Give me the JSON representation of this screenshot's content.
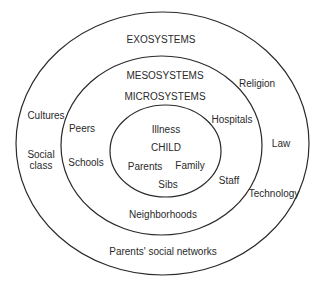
{
  "diagram": {
    "type": "nested-systems",
    "rings": [
      {
        "name": "exosystems",
        "label": "EXOSYSTEMS"
      },
      {
        "name": "mesosystems",
        "label": "MESOSYSTEMS"
      },
      {
        "name": "microsystems",
        "label": "MICROSYSTEMS"
      }
    ],
    "center": {
      "label": "CHILD"
    },
    "inner_items": [
      "Illness",
      "Parents",
      "Family",
      "Sibs"
    ],
    "middle_items": [
      "Peers",
      "Schools",
      "Hospitals",
      "Staff",
      "Neighborhoods"
    ],
    "outer_items": [
      "Cultures",
      "Social class",
      "Religion",
      "Law",
      "Technology",
      "Parents' social networks"
    ],
    "social_class_lines": [
      "Social",
      "class"
    ],
    "line_color": "#2a2a2a"
  }
}
